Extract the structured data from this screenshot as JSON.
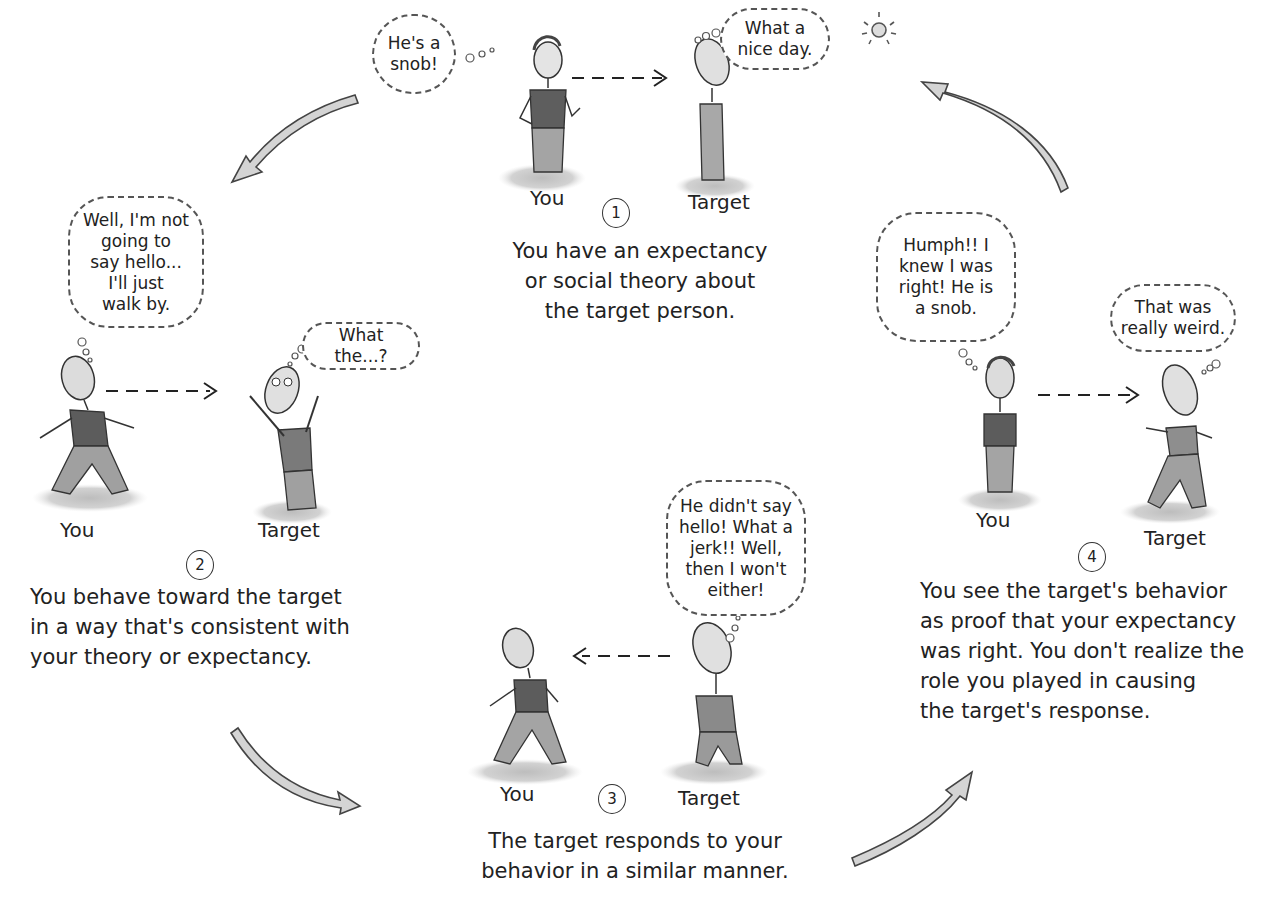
{
  "diagram": {
    "type": "cycle",
    "colors": {
      "ink": "#2a2a2a",
      "arrow_fill": "#cfcfcf",
      "ground": "#c9c9c9",
      "shirt": "#5a5a5a",
      "pants": "#9a9a9a"
    },
    "steps": [
      {
        "number": "1",
        "you_label": "You",
        "target_label": "Target",
        "you_thought": "He's a\nsnob!",
        "target_thought": "What a\nnice day.",
        "caption": "You have an expectancy\nor social theory about\nthe target person.",
        "underlined": [
          "expectancy",
          "theory"
        ],
        "arrow_direction": "you-to-target"
      },
      {
        "number": "2",
        "you_label": "You",
        "target_label": "Target",
        "you_thought": "Well, I'm not\ngoing to\nsay hello...\nI'll just\nwalk by.",
        "target_thought": "What the...?",
        "caption": "You behave toward the target\nin a way that's consistent with\nyour theory or expectancy.",
        "arrow_direction": "you-to-target"
      },
      {
        "number": "3",
        "you_label": "You",
        "target_label": "Target",
        "target_thought": "He didn't say\nhello! What a\njerk!! Well,\nthen I won't\neither!",
        "caption": "The target responds to your\nbehavior in a similar manner.",
        "arrow_direction": "target-to-you"
      },
      {
        "number": "4",
        "you_label": "You",
        "target_label": "Target",
        "you_thought": "Humph!! I\nknew I was\nright! He is\na snob.",
        "target_thought": "That was\nreally weird.",
        "caption": "You see the target's behavior\nas proof that your expectancy\nwas right. You don't realize the\nrole you played in causing\nthe target's response.",
        "underlined": [
          "is",
          "proof",
          "you"
        ],
        "arrow_direction": "you-to-target"
      }
    ],
    "cycle_arrows": [
      {
        "from": "1",
        "to": "2",
        "icon": "curved-arrow-down-left"
      },
      {
        "from": "2",
        "to": "3",
        "icon": "curved-arrow-down-right"
      },
      {
        "from": "3",
        "to": "4",
        "icon": "curved-arrow-up-right"
      },
      {
        "from": "4",
        "to": "1",
        "icon": "curved-arrow-up-left"
      }
    ],
    "decorations": {
      "sun": "sun-icon"
    }
  }
}
